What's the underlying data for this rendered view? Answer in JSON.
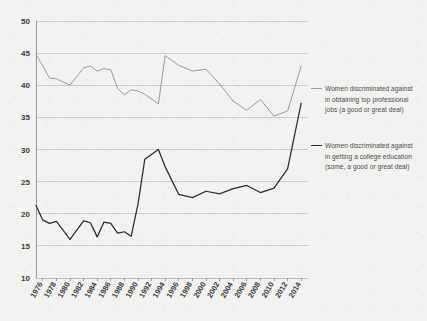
{
  "chart_data": {
    "type": "line",
    "title": "",
    "subtitle": "",
    "xlabel": "",
    "ylabel": "",
    "xlim": [
      1975,
      2015
    ],
    "ylim": [
      10,
      50
    ],
    "yticks": [
      10,
      15,
      20,
      25,
      30,
      35,
      40,
      45,
      50
    ],
    "xticks": [
      1976,
      1978,
      1980,
      1982,
      1984,
      1986,
      1988,
      1990,
      1992,
      1994,
      1996,
      1998,
      2000,
      2002,
      2004,
      2006,
      2008,
      2010,
      2012,
      2014
    ],
    "grid": true,
    "legend_position": "right",
    "x": [
      1975,
      1976,
      1977,
      1978,
      1980,
      1982,
      1983,
      1984,
      1985,
      1986,
      1987,
      1988,
      1989,
      1990,
      1991,
      1993,
      1994,
      1996,
      1998,
      2000,
      2002,
      2004,
      2006,
      2008,
      2010,
      2012,
      2014
    ],
    "series": [
      {
        "name": "Women discriminated against in obtaining top professional jobs (a good or great deal)",
        "color": "#9a9a9a",
        "x": [
          1975,
          1976,
          1977,
          1978,
          1980,
          1982,
          1983,
          1984,
          1985,
          1986,
          1987,
          1988,
          1989,
          1990,
          1991,
          1993,
          1994,
          1996,
          1998,
          2000,
          2002,
          2004,
          2006,
          2008,
          2010,
          2012,
          2014
        ],
        "values": [
          44.8,
          43.0,
          41.1,
          41.0,
          40.0,
          42.7,
          43.0,
          42.2,
          42.6,
          42.4,
          39.5,
          38.5,
          39.3,
          39.1,
          38.6,
          37.1,
          44.6,
          43.1,
          42.2,
          42.5,
          40.2,
          37.5,
          36.1,
          37.8,
          35.2,
          36.0,
          43.0
        ]
      },
      {
        "name": "Women discriminated against in getting a college education (some, a good or great deal)",
        "color": "#2b2b2b",
        "x": [
          1975,
          1976,
          1977,
          1978,
          1980,
          1982,
          1983,
          1984,
          1985,
          1986,
          1987,
          1988,
          1989,
          1990,
          1991,
          1993,
          1994,
          1996,
          1998,
          2000,
          2002,
          2004,
          2006,
          2008,
          2010,
          2012,
          2014
        ],
        "values": [
          21.3,
          19.0,
          18.5,
          18.8,
          16.0,
          18.9,
          18.6,
          16.4,
          18.7,
          18.5,
          17.0,
          17.2,
          16.5,
          21.5,
          28.5,
          30.0,
          27.3,
          23.0,
          22.5,
          23.5,
          23.1,
          23.9,
          24.4,
          23.3,
          24.0,
          27.0,
          37.2
        ]
      }
    ],
    "yticklabels": [
      "10",
      "15",
      "20",
      "25",
      "30",
      "35",
      "40",
      "45",
      "50"
    ],
    "xticklabels": [
      "1976",
      "1978",
      "1980",
      "1982",
      "1984",
      "1986",
      "1988",
      "1990",
      "1992",
      "1994",
      "1996",
      "1998",
      "2000",
      "2002",
      "2004",
      "2006",
      "2008",
      "2010",
      "2012",
      "2014"
    ]
  },
  "legend": {
    "entries": [
      {
        "label": "Women discriminated against in obtaining top professional jobs (a good or great deal)",
        "color": "#9a9a9a"
      },
      {
        "label": "Women discriminated against in getting a college education (some, a good or great deal)",
        "color": "#2b2b2b"
      }
    ]
  },
  "colors": {
    "background": "#f2f2f0",
    "grid": "#b9b9b9",
    "axis": "#8c8c8c",
    "text": "#3a3a3a",
    "series_top": "#9a9a9a",
    "series_bottom": "#2b2b2b"
  }
}
